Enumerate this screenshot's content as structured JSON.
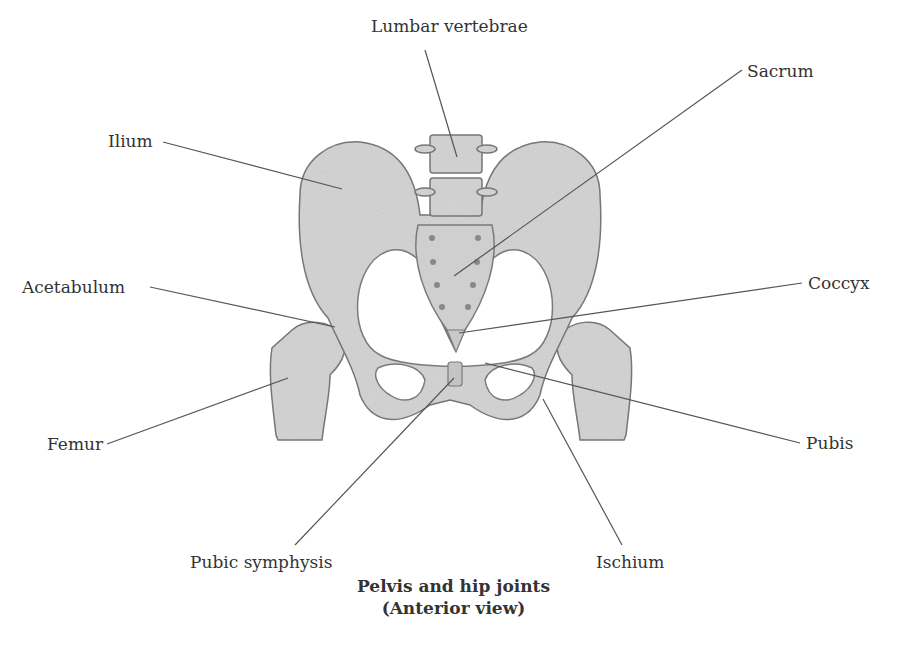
{
  "labels": {
    "lumbar_vertebrae": "Lumbar vertebrae",
    "ilium": "Ilium",
    "sacrum": "Sacrum",
    "acetabulum": "Acetabulum",
    "coccyx": "Coccyx",
    "femur": "Femur",
    "pubis": "Pubis",
    "pubic_symphysis": "Pubic symphysis",
    "ischium": "Ischium"
  },
  "caption": {
    "line1": "Pelvis and hip joints",
    "line2": "(Anterior view)"
  },
  "colors": {
    "bone_fill": "#d6d6d6",
    "bone_stroke": "#7a7a7a",
    "leader_line": "#555555",
    "text": "#333333"
  }
}
